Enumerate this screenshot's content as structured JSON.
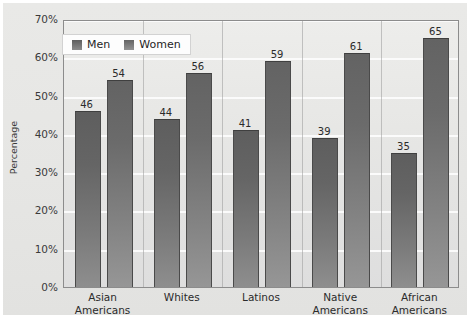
{
  "chart_data": {
    "type": "bar",
    "title": "",
    "xlabel": "",
    "ylabel": "Percentage",
    "ylim": [
      0,
      70
    ],
    "ytick_labels": [
      "0%",
      "10%",
      "20%",
      "30%",
      "40%",
      "50%",
      "60%",
      "70%"
    ],
    "ytick_values": [
      0,
      10,
      20,
      30,
      40,
      50,
      60,
      70
    ],
    "grid": true,
    "legend_position": "top-left-inside",
    "categories": [
      "Asian Americans",
      "Whites",
      "Latinos",
      "Native Americans",
      "African Americans"
    ],
    "category_lines": [
      [
        "Asian",
        "Americans"
      ],
      [
        "Whites",
        ""
      ],
      [
        "Latinos",
        ""
      ],
      [
        "Native",
        "Americans"
      ],
      [
        "African",
        "Americans"
      ]
    ],
    "series": [
      {
        "name": "Men",
        "values": [
          46,
          44,
          41,
          39,
          35
        ],
        "color": "#6b6b6b"
      },
      {
        "name": "Women",
        "values": [
          54,
          56,
          59,
          61,
          65
        ],
        "color": "#767676"
      }
    ],
    "value_labels": [
      [
        "46",
        "54"
      ],
      [
        "44",
        "56"
      ],
      [
        "41",
        "59"
      ],
      [
        "39",
        "61"
      ],
      [
        "35",
        "65"
      ]
    ]
  },
  "colors": {
    "figure_background": "#ffffff",
    "mat_background": "#e7e7e5",
    "plot_background": "#e7e7e5",
    "gridline": "#fbfbfb",
    "axis_line": "#8c8c8c",
    "bar_men": "#6b6b6b",
    "bar_women": "#767676",
    "text": "#2b2b2b",
    "legend_background": "#fdfdfd"
  }
}
